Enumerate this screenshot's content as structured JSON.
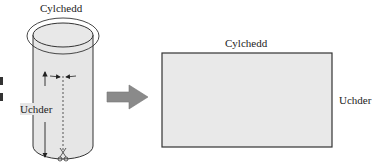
{
  "cylinder": {
    "circumference_label": "Cylchedd",
    "height_label": "Uchder",
    "cut_icon": "scissors-icon"
  },
  "arrow": {
    "icon": "right-arrow-icon",
    "color": "#8a8a8a"
  },
  "rectangle": {
    "top_label": "Cylchedd",
    "side_label": "Uchder",
    "fill": "#e9e9e9",
    "stroke": "#333333"
  },
  "left_marks": [
    "▌",
    "▌"
  ]
}
